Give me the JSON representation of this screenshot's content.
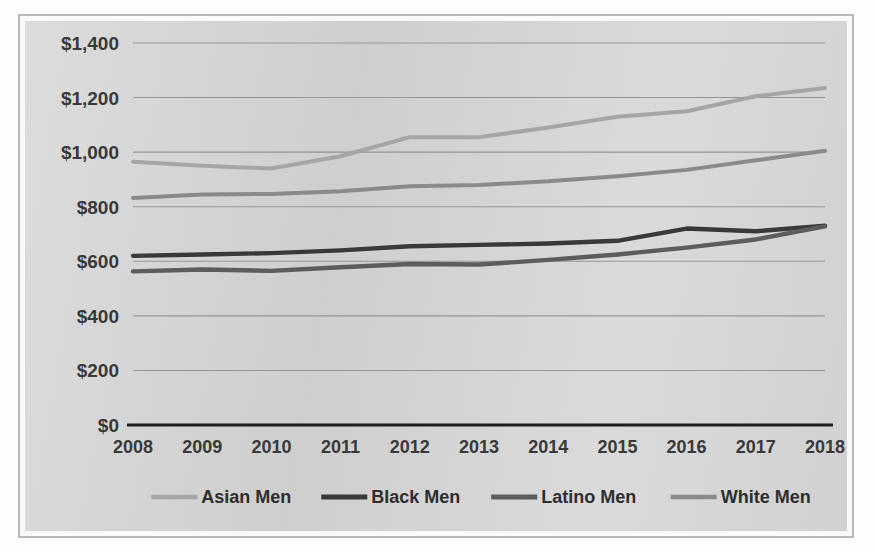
{
  "chart_data": {
    "type": "line",
    "title": "",
    "subtitle": "",
    "xlabel": "",
    "ylabel": "",
    "categories": [
      "2008",
      "2009",
      "2010",
      "2011",
      "2012",
      "2013",
      "2014",
      "2015",
      "2016",
      "2017",
      "2018"
    ],
    "x": [
      2008,
      2009,
      2010,
      2011,
      2012,
      2013,
      2014,
      2015,
      2016,
      2017,
      2018
    ],
    "ylim": [
      0,
      1400
    ],
    "ytick_step": 200,
    "ytick_labels": [
      "$0",
      "$200",
      "$400",
      "$600",
      "$800",
      "$1,000",
      "$1,200",
      "$1,400"
    ],
    "ytick_values": [
      0,
      200,
      400,
      600,
      800,
      1000,
      1200,
      1400
    ],
    "grid": true,
    "grid_axis": "y",
    "legend_position": "bottom",
    "value_prefix": "$",
    "series": [
      {
        "name": "Asian Men",
        "color": "#a8a8a8",
        "width": 4.0,
        "values": [
          965,
          950,
          940,
          985,
          1055,
          1055,
          1090,
          1130,
          1150,
          1205,
          1235
        ]
      },
      {
        "name": "Black Men",
        "color": "#3a3a3a",
        "width": 4.4,
        "values": [
          620,
          625,
          630,
          640,
          655,
          660,
          665,
          675,
          720,
          710,
          730
        ]
      },
      {
        "name": "Latino Men",
        "color": "#5e5e5e",
        "width": 4.4,
        "values": [
          563,
          570,
          565,
          578,
          590,
          588,
          605,
          625,
          650,
          680,
          728
        ]
      },
      {
        "name": "White Men",
        "color": "#8c8c8c",
        "width": 4.0,
        "values": [
          832,
          845,
          847,
          857,
          875,
          880,
          893,
          912,
          935,
          970,
          1005
        ]
      }
    ]
  }
}
